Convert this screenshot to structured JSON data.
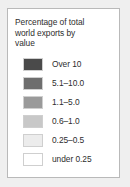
{
  "legend": {
    "title": "Percentage of total world exports by value",
    "title_lines": [
      "Percentage of total",
      "world exports by",
      "value"
    ],
    "panel_background": "#ffffff",
    "panel_border_color": "#b9b9b9",
    "page_background": "#efefef",
    "text_color": "#2e2e2e",
    "swatch_border_color": "#cfcfcf",
    "entries": [
      {
        "label": "Over 10",
        "color": "#4a4a4a"
      },
      {
        "label": "5.1–10.0",
        "color": "#6e6e6e"
      },
      {
        "label": "1.1–5.0",
        "color": "#9a9a9a"
      },
      {
        "label": "0.6–1.0",
        "color": "#c8c8c8"
      },
      {
        "label": "0.25–0.5",
        "color": "#ececec"
      },
      {
        "label": "under 0.25",
        "color": "#ffffff"
      }
    ]
  },
  "chart_data": {
    "type": "table",
    "title": "Percentage of total world exports by value",
    "categories": [
      "Over 10",
      "5.1–10.0",
      "1.1–5.0",
      "0.6–1.0",
      "0.25–0.5",
      "under 0.25"
    ],
    "values": [
      {
        "class": "Over 10",
        "min": 10,
        "max": null,
        "color": "#4a4a4a"
      },
      {
        "class": "5.1–10.0",
        "min": 5.1,
        "max": 10,
        "color": "#6e6e6e"
      },
      {
        "class": "1.1–5.0",
        "min": 1.1,
        "max": 5.0,
        "color": "#9a9a9a"
      },
      {
        "class": "0.6–1.0",
        "min": 0.6,
        "max": 1.0,
        "color": "#c8c8c8"
      },
      {
        "class": "0.25–0.5",
        "min": 0.25,
        "max": 0.5,
        "color": "#ececec"
      },
      {
        "class": "under 0.25",
        "min": null,
        "max": 0.25,
        "color": "#ffffff"
      }
    ],
    "xlabel": "",
    "ylabel": "Percentage of total world exports by value",
    "legend_position": "standalone",
    "grid": false
  }
}
